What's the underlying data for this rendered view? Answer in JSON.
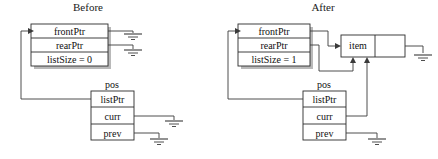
{
  "figure": {
    "kind": "linked-list-pointer-diagram",
    "panels": [
      {
        "id": "before",
        "title": "Before",
        "title_x": 88,
        "title_y": 11,
        "structs": [
          {
            "id": "before-list",
            "name": "",
            "x": 31,
            "y": 24,
            "w": 77,
            "h": 42,
            "fields": [
              {
                "label": "frontPtr",
                "value": "frontPtr"
              },
              {
                "label": "rearPtr",
                "value": "rearPtr"
              },
              {
                "label": "listSize",
                "value": "listSize = 0"
              }
            ]
          },
          {
            "id": "before-pos",
            "name": "pos",
            "name_x": 112,
            "name_y": 88,
            "x": 91,
            "y": 91,
            "w": 43,
            "h": 49,
            "fields": [
              {
                "label": "listPtr",
                "value": "listPtr"
              },
              {
                "label": "curr",
                "value": "curr"
              },
              {
                "label": "prev",
                "value": "prev"
              }
            ]
          }
        ],
        "grounds": [
          {
            "id": "before-frontptr-gnd",
            "x": 122,
            "y": 36
          },
          {
            "id": "before-rearptr-gnd",
            "x": 122,
            "y": 52
          },
          {
            "id": "before-curr-gnd",
            "x": 163,
            "y": 123
          },
          {
            "id": "before-prev-gnd",
            "x": 148,
            "y": 141
          }
        ]
      },
      {
        "id": "after",
        "title": "After",
        "title_x": 323,
        "title_y": 11,
        "structs": [
          {
            "id": "after-list",
            "name": "",
            "x": 238,
            "y": 24,
            "w": 72,
            "h": 42,
            "fields": [
              {
                "label": "frontPtr",
                "value": "frontPtr"
              },
              {
                "label": "rearPtr",
                "value": "rearPtr"
              },
              {
                "label": "listSize",
                "value": "listSize = 1"
              }
            ]
          },
          {
            "id": "after-pos",
            "name": "pos",
            "name_x": 324,
            "name_y": 88,
            "x": 303,
            "y": 91,
            "w": 43,
            "h": 49,
            "fields": [
              {
                "label": "listPtr",
                "value": "listPtr"
              },
              {
                "label": "curr",
                "value": "curr"
              },
              {
                "label": "prev",
                "value": "prev"
              }
            ]
          }
        ],
        "node": {
          "id": "after-item-node",
          "x": 341,
          "y": 35,
          "w": 64,
          "h": 22,
          "divider_x": 375,
          "cells": [
            {
              "label": "item",
              "value": "item"
            },
            {
              "label": "next",
              "value": ""
            }
          ]
        },
        "grounds": [
          {
            "id": "after-node-next-gnd",
            "x": 423,
            "y": 58
          },
          {
            "id": "after-prev-gnd",
            "x": 366,
            "y": 141
          }
        ]
      }
    ],
    "colors": {
      "stroke": "#2b2b2b",
      "wire": "#3a3a3a",
      "shadow": "#b9b9b9",
      "background": "#ffffff",
      "text": "#111111"
    }
  }
}
